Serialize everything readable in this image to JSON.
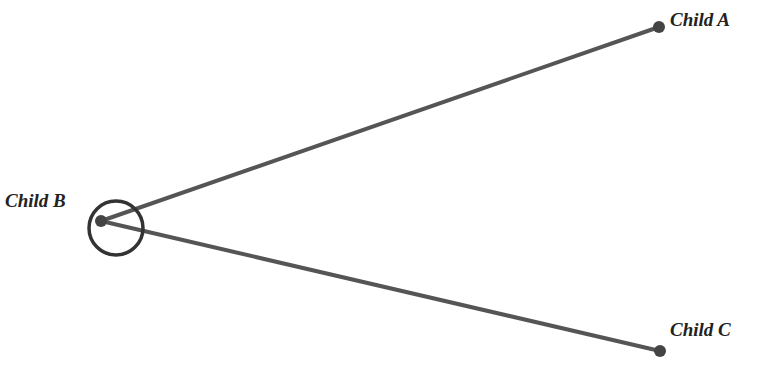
{
  "diagram": {
    "type": "tree",
    "colors": {
      "edge": "#555555",
      "node": "#444444",
      "highlight_ring": "#333333",
      "label": "#222222",
      "background": "#ffffff"
    },
    "nodes": [
      {
        "id": "A",
        "label": "Child A",
        "x": 659,
        "y": 27,
        "label_x": 670,
        "label_y": 26
      },
      {
        "id": "B",
        "label": "Child B",
        "x": 101,
        "y": 221,
        "label_x": 5,
        "label_y": 207,
        "selected": true
      },
      {
        "id": "C",
        "label": "Child C",
        "x": 660,
        "y": 351,
        "label_x": 670,
        "label_y": 336
      }
    ],
    "edges": [
      {
        "from": "B",
        "to": "A"
      },
      {
        "from": "B",
        "to": "C"
      }
    ],
    "selection_ring": {
      "cx": 116,
      "cy": 228,
      "r": 27
    }
  }
}
